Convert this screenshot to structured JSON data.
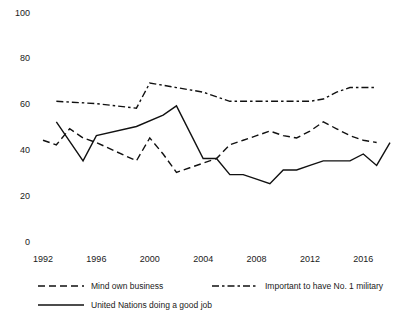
{
  "chart_data": {
    "type": "line",
    "title": "",
    "subtitle": "",
    "xlabel": "",
    "ylabel": "",
    "xlim": [
      1992,
      2018
    ],
    "ylim": [
      0,
      100
    ],
    "grid": false,
    "legend_position": "bottom",
    "yticks": [
      0,
      20,
      40,
      60,
      80,
      100
    ],
    "ytick_labels": [
      "0",
      "20",
      "40",
      "60",
      "80",
      "100"
    ],
    "xticks": [
      1992,
      1996,
      2000,
      2004,
      2008,
      2012,
      2016
    ],
    "xtick_labels": [
      "1992",
      "1996",
      "2000",
      "2004",
      "2008",
      "2012",
      "2016"
    ],
    "series": [
      {
        "name": "Mind own business",
        "style": "dashed",
        "color": "#111111",
        "x": [
          1992,
          1993,
          1994,
          1995,
          1996,
          1999,
          2000,
          2001,
          2002,
          2003,
          2004,
          2005,
          2006,
          2007,
          2008,
          2009,
          2010,
          2011,
          2012,
          2013,
          2014,
          2015,
          2016,
          2017
        ],
        "values": [
          44,
          42,
          49,
          45,
          43,
          35,
          45,
          38,
          30,
          32,
          34,
          36,
          42,
          44,
          46,
          48,
          46,
          45,
          48,
          52,
          49,
          46,
          44,
          43
        ]
      },
      {
        "name": "Important to have No. 1 military",
        "style": "dashdot",
        "color": "#111111",
        "x": [
          1993,
          1996,
          1999,
          2000,
          2002,
          2004,
          2006,
          2008,
          2010,
          2011,
          2012,
          2013,
          2014,
          2015,
          2016,
          2017
        ],
        "values": [
          61,
          60,
          58,
          69,
          67,
          65,
          61,
          61,
          61,
          61,
          61,
          62,
          65,
          67,
          67,
          67
        ]
      },
      {
        "name": "United Nations doing a good job",
        "style": "solid",
        "color": "#111111",
        "x": [
          1993,
          1995,
          1996,
          1999,
          2001,
          2002,
          2004,
          2005,
          2006,
          2007,
          2008,
          2009,
          2010,
          2011,
          2012,
          2013,
          2014,
          2015,
          2016,
          2017,
          2018
        ],
        "values": [
          52,
          35,
          46,
          50,
          55,
          59,
          36,
          36,
          29,
          29,
          27,
          25,
          31,
          31,
          33,
          35,
          35,
          35,
          38,
          33,
          43
        ]
      }
    ]
  },
  "legend": {
    "items": [
      {
        "label": "Mind own business",
        "style": "dashed"
      },
      {
        "label": "Important to have No. 1 military",
        "style": "dashdot"
      },
      {
        "label": "United Nations doing a good job",
        "style": "solid"
      }
    ]
  }
}
